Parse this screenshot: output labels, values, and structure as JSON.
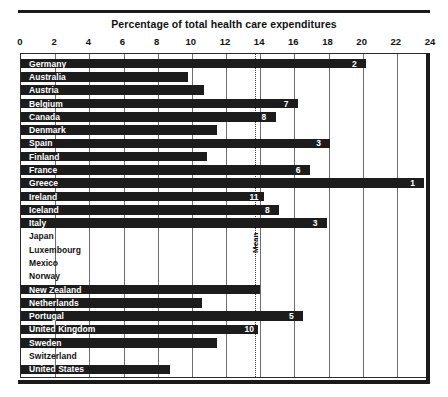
{
  "chart_data": {
    "type": "bar",
    "orientation": "horizontal",
    "title": "Percentage of total health care expenditures",
    "xlabel": "",
    "ylabel": "",
    "xlim": [
      0,
      24
    ],
    "xticks": [
      0,
      2,
      4,
      6,
      8,
      10,
      12,
      14,
      16,
      18,
      20,
      22,
      24
    ],
    "grid": true,
    "legend": false,
    "annotations": [
      {
        "label": "Mean",
        "type": "reference-line",
        "orientation": "vertical",
        "value": 13.7,
        "style": "dotted"
      }
    ],
    "categories": [
      "Germany",
      "Australia",
      "Austria",
      "Belgium",
      "Canada",
      "Denmark",
      "Spain",
      "Finland",
      "France",
      "Greece",
      "Ireland",
      "Iceland",
      "Italy",
      "Japan",
      "Luxembourg",
      "Mexico",
      "Norway",
      "New Zealand",
      "Netherlands",
      "Portugal",
      "United Kingdom",
      "Sweden",
      "Switzerland",
      "United States"
    ],
    "values": [
      20.2,
      9.8,
      10.7,
      16.2,
      14.9,
      11.5,
      18.1,
      10.9,
      16.9,
      23.6,
      14.2,
      15.1,
      17.9,
      null,
      null,
      null,
      null,
      14.0,
      10.6,
      16.5,
      13.9,
      11.5,
      null,
      8.7
    ],
    "data_labels": [
      "2",
      "",
      "",
      "7",
      "8",
      "",
      "3",
      "",
      "6",
      "1",
      "11",
      "8",
      "3",
      "",
      "",
      "",
      "",
      "",
      "",
      "5",
      "10",
      "",
      "",
      ""
    ],
    "rows": [
      {
        "country": "Germany",
        "value": 20.2,
        "rank": "2",
        "has_bar": true
      },
      {
        "country": "Australia",
        "value": 9.8,
        "rank": "",
        "has_bar": true
      },
      {
        "country": "Austria",
        "value": 10.7,
        "rank": "",
        "has_bar": true
      },
      {
        "country": "Belgium",
        "value": 16.2,
        "rank": "7",
        "has_bar": true
      },
      {
        "country": "Canada",
        "value": 14.9,
        "rank": "8",
        "has_bar": true
      },
      {
        "country": "Denmark",
        "value": 11.5,
        "rank": "",
        "has_bar": true
      },
      {
        "country": "Spain",
        "value": 18.1,
        "rank": "3",
        "has_bar": true
      },
      {
        "country": "Finland",
        "value": 10.9,
        "rank": "",
        "has_bar": true
      },
      {
        "country": "France",
        "value": 16.9,
        "rank": "6",
        "has_bar": true
      },
      {
        "country": "Greece",
        "value": 23.6,
        "rank": "1",
        "has_bar": true
      },
      {
        "country": "Ireland",
        "value": 14.2,
        "rank": "11",
        "has_bar": true
      },
      {
        "country": "Iceland",
        "value": 15.1,
        "rank": "8",
        "has_bar": true
      },
      {
        "country": "Italy",
        "value": 17.9,
        "rank": "3",
        "has_bar": true
      },
      {
        "country": "Japan",
        "value": 0,
        "rank": "",
        "has_bar": false
      },
      {
        "country": "Luxembourg",
        "value": 0,
        "rank": "",
        "has_bar": false
      },
      {
        "country": "Mexico",
        "value": 0,
        "rank": "",
        "has_bar": false
      },
      {
        "country": "Norway",
        "value": 0,
        "rank": "",
        "has_bar": false
      },
      {
        "country": "New Zealand",
        "value": 14.0,
        "rank": "",
        "has_bar": true
      },
      {
        "country": "Netherlands",
        "value": 10.6,
        "rank": "",
        "has_bar": true
      },
      {
        "country": "Portugal",
        "value": 16.5,
        "rank": "5",
        "has_bar": true
      },
      {
        "country": "United Kingdom",
        "value": 13.9,
        "rank": "10",
        "has_bar": true
      },
      {
        "country": "Sweden",
        "value": 11.5,
        "rank": "",
        "has_bar": true
      },
      {
        "country": "Switzerland",
        "value": 0,
        "rank": "",
        "has_bar": false
      },
      {
        "country": "United States",
        "value": 8.7,
        "rank": "",
        "has_bar": true
      }
    ]
  },
  "colors": {
    "bar": "#1c1c1c",
    "grid": "#6f6f6f",
    "frame": "#2a2a2a",
    "rule": "#1a1a1a",
    "label_on_bar": "#ffffff",
    "label_off_bar": "#111111",
    "background": "#ffffff"
  }
}
